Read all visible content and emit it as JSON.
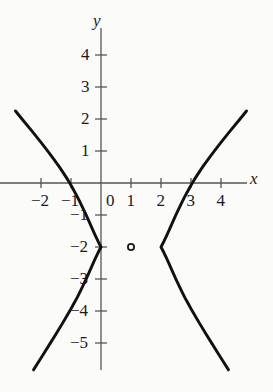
{
  "figure": {
    "kind": "cartesian-graph",
    "background_color": "#fbfbfa",
    "ink_color": "#1a1a1a",
    "axis_color": "#555555",
    "curve_color": "#101010",
    "axis_labels": {
      "x": "x",
      "y": "y"
    },
    "x_axis": {
      "ticks": [
        -2,
        -1,
        1,
        2,
        3,
        4
      ],
      "tick_labels": [
        "-2",
        "-1",
        "1",
        "2",
        "3",
        "4"
      ],
      "origin_label": "0",
      "range": [
        -2.9,
        5.1
      ],
      "pixels_per_unit": 30
    },
    "y_axis": {
      "ticks": [
        4,
        3,
        2,
        1,
        -1,
        -2,
        -3,
        -4,
        -5
      ],
      "tick_labels": [
        "4",
        "3",
        "2",
        "1",
        "-1",
        "-2",
        "-3",
        "-4",
        "-5"
      ],
      "range": [
        -6.2,
        5.3
      ],
      "pixels_per_unit": 32
    },
    "open_point": {
      "x": 1,
      "y": -2,
      "style": "open-circle"
    }
  },
  "chart_data": {
    "type": "line",
    "title": "",
    "xlabel": "x",
    "ylabel": "y",
    "grid": false,
    "legend": null,
    "xlim": [
      -2.9,
      5.1
    ],
    "ylim": [
      -6.2,
      5.3
    ],
    "xticks": [
      -2,
      -1,
      0,
      1,
      2,
      3,
      4
    ],
    "yticks": [
      4,
      3,
      2,
      1,
      -1,
      -2,
      -3,
      -4,
      -5
    ],
    "curve": {
      "name": "hyperbola",
      "center": [
        1,
        -2
      ],
      "a": 1,
      "b": 1.1547,
      "orientation": "horizontal",
      "equation": "(x-1)^2/1 - (y+2)^2/1.3333 = 1",
      "vertices": [
        [
          0,
          -2
        ],
        [
          2,
          -2
        ]
      ],
      "x_intercepts": [
        -1,
        3
      ],
      "asymptote_slopes": [
        1.1547,
        -1.1547
      ]
    },
    "series": [
      {
        "name": "left-branch",
        "points": [
          [
            -2.85,
            2.25
          ],
          [
            -2.6,
            1.96
          ],
          [
            -2.3,
            1.62
          ],
          [
            -2.0,
            1.27
          ],
          [
            -1.8,
            1.03
          ],
          [
            -1.6,
            0.78
          ],
          [
            -1.4,
            0.52
          ],
          [
            -1.25,
            0.31
          ],
          [
            -1.1,
            0.09
          ],
          [
            -1.0,
            -0.07
          ],
          [
            -0.9,
            -0.24
          ],
          [
            -0.8,
            -0.41
          ],
          [
            -0.7,
            -0.6
          ],
          [
            -0.6,
            -0.79
          ],
          [
            -0.5,
            -0.99
          ],
          [
            -0.4,
            -1.2
          ],
          [
            -0.3,
            -1.41
          ],
          [
            -0.2,
            -1.62
          ],
          [
            -0.1,
            -1.82
          ],
          [
            0.0,
            -2.0
          ],
          [
            -0.1,
            -2.18
          ],
          [
            -0.2,
            -2.38
          ],
          [
            -0.3,
            -2.59
          ],
          [
            -0.4,
            -2.8
          ],
          [
            -0.5,
            -3.01
          ],
          [
            -0.6,
            -3.21
          ],
          [
            -0.7,
            -3.4
          ],
          [
            -0.8,
            -3.59
          ],
          [
            -0.9,
            -3.76
          ],
          [
            -1.0,
            -3.93
          ],
          [
            -1.15,
            -4.17
          ],
          [
            -1.3,
            -4.41
          ],
          [
            -1.5,
            -4.72
          ],
          [
            -1.7,
            -5.02
          ],
          [
            -1.9,
            -5.32
          ],
          [
            -2.1,
            -5.62
          ],
          [
            -2.25,
            -5.84
          ]
        ]
      },
      {
        "name": "right-branch",
        "points": [
          [
            4.85,
            2.25
          ],
          [
            4.6,
            1.96
          ],
          [
            4.3,
            1.62
          ],
          [
            4.0,
            1.27
          ],
          [
            3.8,
            1.03
          ],
          [
            3.6,
            0.78
          ],
          [
            3.4,
            0.52
          ],
          [
            3.25,
            0.31
          ],
          [
            3.1,
            0.09
          ],
          [
            3.0,
            -0.07
          ],
          [
            2.9,
            -0.24
          ],
          [
            2.8,
            -0.41
          ],
          [
            2.7,
            -0.6
          ],
          [
            2.6,
            -0.79
          ],
          [
            2.5,
            -0.99
          ],
          [
            2.4,
            -1.2
          ],
          [
            2.3,
            -1.41
          ],
          [
            2.2,
            -1.62
          ],
          [
            2.1,
            -1.82
          ],
          [
            2.0,
            -2.0
          ],
          [
            2.1,
            -2.18
          ],
          [
            2.2,
            -2.38
          ],
          [
            2.3,
            -2.59
          ],
          [
            2.4,
            -2.8
          ],
          [
            2.5,
            -3.01
          ],
          [
            2.6,
            -3.21
          ],
          [
            2.7,
            -3.4
          ],
          [
            2.8,
            -3.59
          ],
          [
            2.9,
            -3.76
          ],
          [
            3.0,
            -3.93
          ],
          [
            3.15,
            -4.17
          ],
          [
            3.3,
            -4.41
          ],
          [
            3.5,
            -4.72
          ],
          [
            3.7,
            -5.02
          ],
          [
            3.9,
            -5.32
          ],
          [
            4.1,
            -5.62
          ],
          [
            4.25,
            -5.84
          ]
        ]
      }
    ],
    "annotations": [
      {
        "type": "open-circle",
        "x": 1,
        "y": -2,
        "label": ""
      }
    ]
  }
}
